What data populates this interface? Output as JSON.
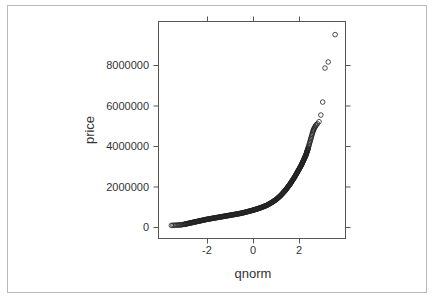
{
  "chart_data": {
    "type": "scatter",
    "title": "",
    "xlabel": "qnorm",
    "ylabel": "price",
    "xlim": [
      -4.13,
      4.04
    ],
    "ylim": [
      -550000,
      10150000
    ],
    "grid": false,
    "legend": null,
    "x_ticks": [
      -2,
      0,
      2
    ],
    "x_tick_labels": [
      "-2",
      "0",
      "2"
    ],
    "y_ticks": [
      0,
      2000000,
      4000000,
      6000000,
      8000000
    ],
    "y_tick_labels": [
      "0",
      "2000000",
      "4000000",
      "6000000",
      "8000000"
    ],
    "marker": "open-circle",
    "curve_points": [
      [
        -3.55,
        80000
      ],
      [
        -3.3,
        95000
      ],
      [
        -3.2,
        100000
      ],
      [
        -3.1,
        110000
      ],
      [
        -3.0,
        130000
      ],
      [
        -2.8,
        180000
      ],
      [
        -2.6,
        230000
      ],
      [
        -2.4,
        280000
      ],
      [
        -2.2,
        330000
      ],
      [
        -2.0,
        380000
      ],
      [
        -1.8,
        420000
      ],
      [
        -1.6,
        460000
      ],
      [
        -1.4,
        500000
      ],
      [
        -1.2,
        540000
      ],
      [
        -1.0,
        580000
      ],
      [
        -0.8,
        620000
      ],
      [
        -0.6,
        660000
      ],
      [
        -0.4,
        710000
      ],
      [
        -0.2,
        770000
      ],
      [
        0.0,
        830000
      ],
      [
        0.2,
        900000
      ],
      [
        0.4,
        980000
      ],
      [
        0.6,
        1070000
      ],
      [
        0.8,
        1200000
      ],
      [
        1.0,
        1350000
      ],
      [
        1.2,
        1550000
      ],
      [
        1.4,
        1800000
      ],
      [
        1.6,
        2100000
      ],
      [
        1.8,
        2450000
      ],
      [
        2.0,
        2850000
      ],
      [
        2.1,
        3050000
      ],
      [
        2.2,
        3300000
      ],
      [
        2.3,
        3550000
      ],
      [
        2.4,
        3900000
      ],
      [
        2.45,
        4100000
      ],
      [
        2.5,
        4300000
      ],
      [
        2.55,
        4500000
      ],
      [
        2.6,
        4700000
      ],
      [
        2.65,
        4850000
      ],
      [
        2.7,
        4950000
      ],
      [
        2.75,
        5050000
      ],
      [
        2.8,
        5100000
      ]
    ],
    "outliers": [
      [
        2.87,
        5200000
      ],
      [
        2.95,
        5530000
      ],
      [
        3.03,
        6170000
      ],
      [
        3.13,
        7850000
      ],
      [
        3.27,
        8150000
      ],
      [
        3.57,
        9500000
      ]
    ]
  },
  "labels": {
    "xlabel": "qnorm",
    "ylabel": "price",
    "x_ticks": [
      "-2",
      "0",
      "2"
    ],
    "y_ticks": [
      "0",
      "2000000",
      "4000000",
      "6000000",
      "8000000"
    ]
  }
}
